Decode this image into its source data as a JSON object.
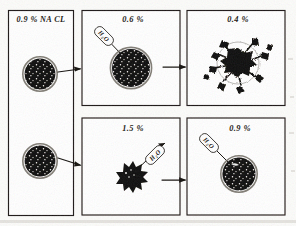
{
  "figure": {
    "type": "hand-drawn biology diagram",
    "background_color": "#fcfcfa",
    "ink_color": "#17140f"
  },
  "panels": [
    {
      "id": "panel-isotonic-source",
      "position": "left-tall",
      "label": "0.9 % NA CL",
      "stipple": "medium",
      "cells": [
        {
          "id": "cell-normal-top",
          "state": "normal biconcave cell",
          "shape": "circle"
        },
        {
          "id": "cell-normal-bottom",
          "state": "normal biconcave cell",
          "shape": "circle"
        }
      ]
    },
    {
      "id": "panel-hypotonic-06",
      "position": "top-middle",
      "label": "0.6 %",
      "stipple": "sparse",
      "water_label": "H₂O",
      "water_direction": "into cell",
      "cells": [
        {
          "id": "cell-swollen",
          "state": "swollen cell",
          "shape": "circle"
        }
      ]
    },
    {
      "id": "panel-hypotonic-04",
      "position": "top-right",
      "label": "0.4 %",
      "stipple": "sparse",
      "cells": [
        {
          "id": "cell-lysed",
          "state": "hemolysed / burst cell",
          "shape": "irregular splatter"
        }
      ]
    },
    {
      "id": "panel-hypertonic-15",
      "position": "bottom-middle",
      "label": "1.5 %",
      "stipple": "dense",
      "water_label": "H₂O",
      "water_direction": "out of cell",
      "cells": [
        {
          "id": "cell-crenated",
          "state": "crenated / shrunken cell",
          "shape": "spiky star"
        }
      ]
    },
    {
      "id": "panel-isotonic-09",
      "position": "bottom-right",
      "label": "0.9 %",
      "stipple": "medium",
      "water_label": "H₂O",
      "water_direction": "into cell",
      "cells": [
        {
          "id": "cell-restored",
          "state": "restored normal cell",
          "shape": "circle"
        }
      ]
    }
  ],
  "arrows": [
    {
      "id": "arrow-1",
      "from": "panel-isotonic-source",
      "to": "panel-hypotonic-06",
      "direction": "right"
    },
    {
      "id": "arrow-2",
      "from": "panel-hypotonic-06",
      "to": "panel-hypotonic-04",
      "direction": "right"
    },
    {
      "id": "arrow-3",
      "from": "panel-isotonic-source",
      "to": "panel-hypertonic-15",
      "direction": "right-down"
    },
    {
      "id": "arrow-4",
      "from": "panel-hypertonic-15",
      "to": "panel-isotonic-09",
      "direction": "right"
    }
  ],
  "water_labels": {
    "text": "H₂O",
    "h": "H",
    "two": "2",
    "o": "O"
  }
}
